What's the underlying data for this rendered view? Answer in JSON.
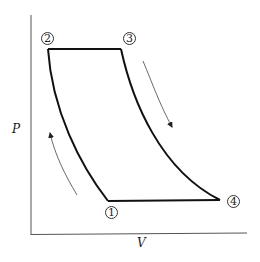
{
  "diagram": {
    "type": "P-V diagram",
    "axes": {
      "x_label": "V",
      "y_label": "P"
    },
    "states": [
      {
        "id": "1",
        "label": "1"
      },
      {
        "id": "2",
        "label": "2"
      },
      {
        "id": "3",
        "label": "3"
      },
      {
        "id": "4",
        "label": "4"
      }
    ],
    "processes": [
      {
        "from": "1",
        "to": "2",
        "shape": "curve"
      },
      {
        "from": "2",
        "to": "3",
        "shape": "horizontal line"
      },
      {
        "from": "3",
        "to": "4",
        "shape": "curve"
      },
      {
        "from": "4",
        "to": "1",
        "shape": "horizontal line"
      }
    ],
    "flow_arrows": [
      {
        "name": "expansion-direction",
        "direction": "down-right"
      },
      {
        "name": "compression-direction",
        "direction": "up-left"
      }
    ],
    "colors": {
      "cycle": "#111111",
      "axis": "#555555",
      "arrow": "#444444"
    }
  }
}
